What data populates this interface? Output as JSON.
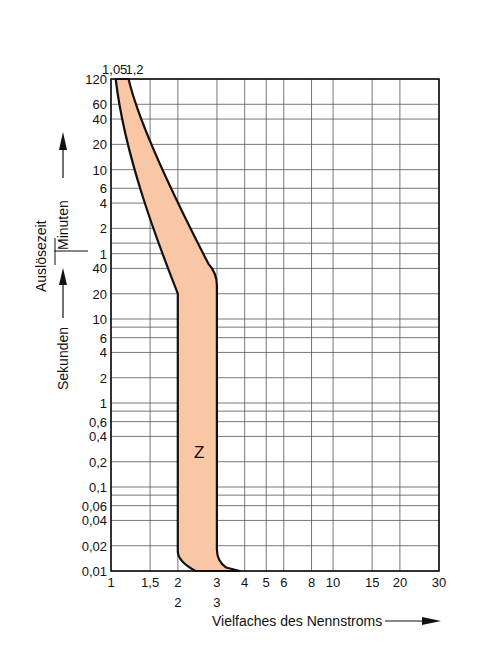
{
  "chart_data": {
    "type": "area",
    "title": "",
    "xlabel": "Vielfaches des Nennstroms",
    "ylabel": "Auslösezeit",
    "ylabel_minutes": "Minuten",
    "ylabel_seconds": "Sekunden",
    "x_scale": "log",
    "y_scale": "log",
    "xlim": [
      1,
      30
    ],
    "x_ticks": [
      "1",
      "1,5",
      "2",
      "3",
      "4",
      "5",
      "6",
      "8",
      "10",
      "15",
      "20",
      "30"
    ],
    "x_ticks_second_row": [
      "2",
      "3"
    ],
    "top_ticks": [
      "1,05",
      "1,2"
    ],
    "y_ticks_minutes": [
      "120",
      "60",
      "40",
      "20",
      "10",
      "6",
      "4",
      "2",
      "1"
    ],
    "y_ticks_seconds": [
      "40",
      "20",
      "10",
      "6",
      "4",
      "2",
      "1",
      "0,6",
      "0,4",
      "0,2",
      "0,1",
      "0,06",
      "0,04",
      "0,02",
      "0,01"
    ],
    "grid": true,
    "series": [
      {
        "name": "Z",
        "label": "Z",
        "fill_color": "#f9c6a6",
        "edge_color": "#111111",
        "lower_bound_x": [
          1.05,
          1.2,
          1.5,
          2.0,
          2.0,
          2.2
        ],
        "lower_bound_t_s": [
          7200,
          1200,
          300,
          20,
          0.015,
          0.01
        ],
        "upper_bound_x": [
          1.2,
          1.5,
          2.0,
          3.0,
          3.0,
          3.4,
          3.8
        ],
        "upper_bound_t_s": [
          7200,
          900,
          180,
          30,
          0.015,
          0.011,
          0.01
        ]
      }
    ]
  }
}
